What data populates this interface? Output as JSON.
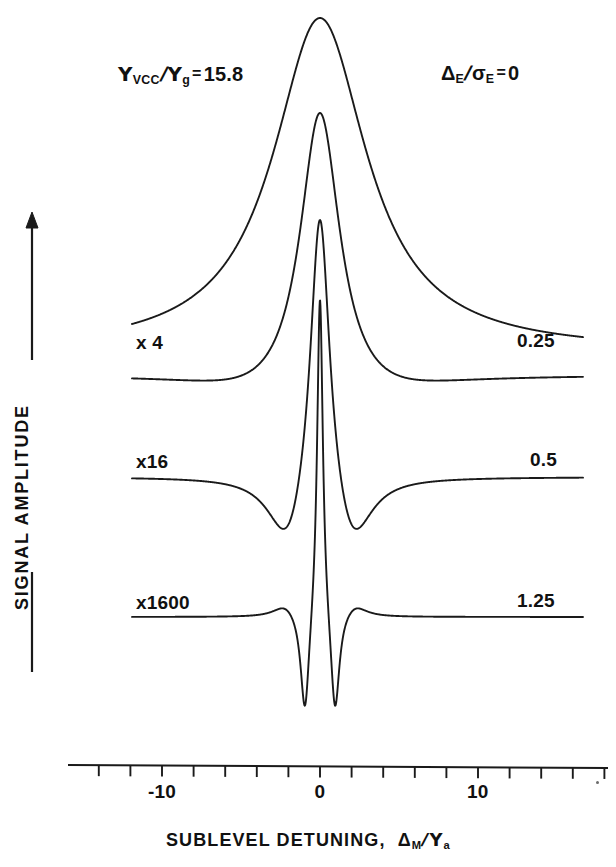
{
  "figure": {
    "title_text": "",
    "background_color": "#ffffff",
    "line_color": "#1a1a1a"
  },
  "annotations": {
    "left_param": {
      "symbol_num": "Υ",
      "symbol_num_sub": "VCC",
      "symbol_den": "Υ",
      "symbol_den_sub": "g",
      "equals": "=",
      "value": "15.8",
      "plain": "ΥVCC/Υg = 15.8"
    },
    "right_param": {
      "symbol_num": "Δ",
      "symbol_num_sub": "E",
      "symbol_den": "σ",
      "symbol_den_sub": "E",
      "equals": "=",
      "value": "0",
      "plain": "ΔE/σE = 0"
    }
  },
  "y_axis": {
    "title": "SIGNAL AMPLITUDE",
    "has_up_arrow": true,
    "has_lower_rule": true
  },
  "x_axis": {
    "title_prefix": "SUBLEVEL DETUNING,",
    "title_symbol_num": "Δ",
    "title_symbol_num_sub": "M",
    "title_symbol_den": "Υ",
    "title_symbol_den_sub": "a",
    "title_plain": "SUBLEVEL DETUNING, ΔM/Υa",
    "tick_labels": [
      "-10",
      "0",
      "10"
    ],
    "tick_label_values": [
      -10,
      0,
      10
    ],
    "minor_tick_count": 18,
    "range": [
      -16,
      18.5
    ]
  },
  "curve_labels": {
    "left": [
      "x 4",
      "x16",
      "x1600"
    ],
    "right": [
      "0.25",
      "0.5",
      "1.25"
    ]
  },
  "chart_data": {
    "type": "line",
    "xlabel": "SUBLEVEL DETUNING, ΔM/Υa",
    "ylabel": "SIGNAL AMPLITUDE",
    "xlim": [
      -16,
      18.5
    ],
    "grid": false,
    "legend": "none",
    "annotations": [
      "ΥVCC/Υg = 15.8",
      "ΔE/ΥE = 0"
    ],
    "series": [
      {
        "name": "gamma_ratio_0",
        "right_label": "",
        "left_label": "",
        "scale_factor": 1,
        "baseline_y": 352,
        "peak_y": 18,
        "description": "broad Lorentzian-like peak with sharp narrow core, no negative lobes",
        "broad_width": 3.6,
        "broad_amp": 334,
        "narrow_width": 0.26,
        "narrow_amp": 0,
        "dip_amp": 0,
        "dip_width": 0
      },
      {
        "name": "gamma_ratio_0p25",
        "right_label": "0.25",
        "left_label": "x 4",
        "scale_factor": 4,
        "baseline_y": 375,
        "peak_y": 113,
        "description": "medium peak with shallow broad negative lobes",
        "broad_width": 1.55,
        "broad_amp": 262,
        "narrow_width": 0.24,
        "narrow_amp": 0,
        "dip_amp": 20,
        "dip_width": 5.2,
        "dip_center": 3.2
      },
      {
        "name": "gamma_ratio_0p5",
        "right_label": "0.5",
        "left_label": "x16",
        "scale_factor": 16,
        "baseline_y": 477,
        "peak_y": 220,
        "description": "narrow peak with deeper narrow negative lobes",
        "broad_width": 0.75,
        "broad_amp": 257,
        "narrow_width": 0.22,
        "narrow_amp": 0,
        "dip_amp": 63,
        "dip_width": 1.5,
        "dip_center": 2.0
      },
      {
        "name": "gamma_ratio_1p25",
        "right_label": "1.25",
        "left_label": "x1600",
        "scale_factor": 1600,
        "baseline_y": 617,
        "peak_y": 300,
        "description": "very narrow central peak flanked by deep narrow dips and small positive overshoots",
        "broad_width": 0.22,
        "broad_amp": 320,
        "narrow_width": 0.18,
        "narrow_amp": 0,
        "dip_amp": 102,
        "dip_width": 0.34,
        "dip_center": 0.95,
        "overshoot_amp": 12,
        "overshoot_center": 2.2,
        "overshoot_width": 0.9
      }
    ]
  },
  "geometry": {
    "plot_left_x": 132,
    "plot_right_x": 583,
    "axis_line_y": 765,
    "axis_left_x": 68,
    "axis_right_x": 608,
    "x_zero_px": 320,
    "px_per_unit": 15.8
  }
}
